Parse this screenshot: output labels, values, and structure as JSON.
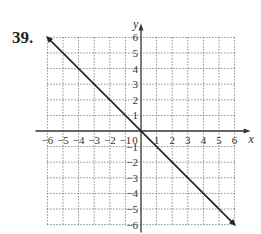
{
  "problem_number": "39.",
  "chart_data": {
    "type": "line",
    "title": "",
    "xlabel": "x",
    "ylabel": "y",
    "xlim": [
      -6,
      6
    ],
    "ylim": [
      -6,
      6
    ],
    "grid": true,
    "x_ticks": [
      -6,
      -5,
      -4,
      -3,
      -2,
      -1,
      0,
      1,
      2,
      3,
      4,
      5,
      6
    ],
    "y_ticks": [
      -6,
      -5,
      -4,
      -3,
      -2,
      -1,
      1,
      2,
      3,
      4,
      5,
      6
    ],
    "series": [
      {
        "name": "y = -x",
        "x": [
          -6,
          6
        ],
        "y": [
          6,
          -6
        ],
        "arrows": "both"
      }
    ],
    "colors": {
      "line": "#222222",
      "grid": "#555555",
      "axis": "#333333"
    }
  }
}
